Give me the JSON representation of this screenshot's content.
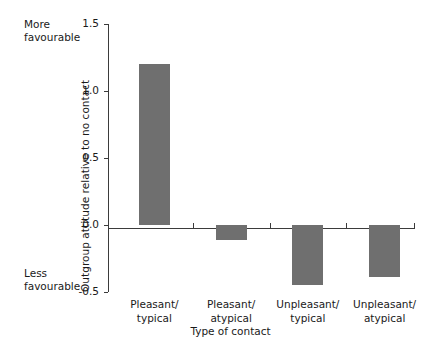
{
  "chart_data": {
    "type": "bar",
    "title": "",
    "subtitle": "",
    "xlabel": "Type of contact",
    "ylabel": "Outgroup attitude relative to no contact",
    "categories": [
      "Pleasant/\ntypical",
      "Pleasant/\natypical",
      "Unpleasant/\ntypical",
      "Unpleasant/\natypical"
    ],
    "values": [
      1.2,
      -0.11,
      -0.45,
      -0.39
    ],
    "ylim": [
      -0.5,
      1.5
    ],
    "yticks": [
      1.5,
      1.0,
      0.5,
      0.0,
      -0.5
    ],
    "ytick_labels": [
      "1.5",
      "1.0",
      "0.5",
      "0.0",
      "-0.5"
    ],
    "grid": false,
    "legend": "none",
    "bar_color": "#6f6f6f",
    "axis_color": "#3b3b3b",
    "annotations": {
      "top_anchor": "More\nfavourable",
      "bottom_anchor": "Less\nfavourable"
    }
  },
  "axis": {
    "ylabel": "Outgroup attitude relative to no contact",
    "xlabel": "Type of contact",
    "ticks": [
      {
        "label": "1.5"
      },
      {
        "label": "1.0"
      },
      {
        "label": "0.5"
      },
      {
        "label": "0.0"
      },
      {
        "label": "-0.5"
      }
    ]
  },
  "anchors": {
    "more": "More\nfavourable",
    "less": "Less\nfavourable"
  },
  "bars": [
    {
      "label": "Pleasant/\ntypical",
      "value": 1.2
    },
    {
      "label": "Pleasant/\natypical",
      "value": -0.11
    },
    {
      "label": "Unpleasant/\ntypical",
      "value": -0.45
    },
    {
      "label": "Unpleasant/\natypical",
      "value": -0.39
    }
  ]
}
